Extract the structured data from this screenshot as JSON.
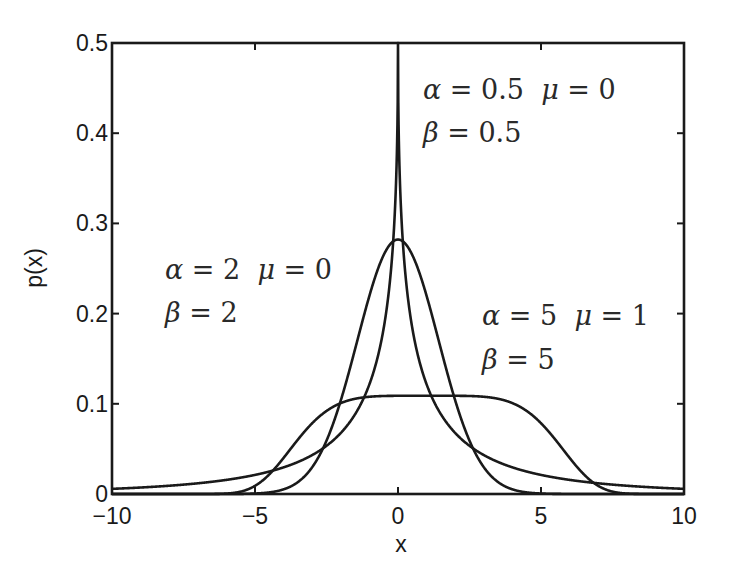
{
  "chart_data": {
    "type": "line",
    "title": "",
    "xlabel": "x",
    "ylabel": "p(x)",
    "xlim": [
      -10,
      10
    ],
    "ylim": [
      0,
      0.5
    ],
    "grid": false,
    "legend": "none (inline annotations)",
    "x_ticks": [
      -10,
      -5,
      0,
      5,
      10
    ],
    "x_tick_labels": [
      "−10",
      "−5",
      "0",
      "5",
      "10"
    ],
    "y_ticks": [
      0,
      0.1,
      0.2,
      0.3,
      0.4,
      0.5
    ],
    "y_tick_labels": [
      "0",
      "0.1",
      "0.2",
      "0.3",
      "0.4",
      "0.5"
    ],
    "formula": "p(x) = beta / (2 * alpha * Gamma(1/beta)) * exp(-(|x - mu| / alpha)^beta)",
    "series": [
      {
        "name": "alpha=0.5, mu=0, beta=0.5",
        "alpha": 0.5,
        "mu": 0,
        "beta": 0.5,
        "peak": 0.5,
        "x": [
          -10,
          -5,
          -2,
          -1,
          -0.5,
          0,
          0.5,
          1,
          2,
          5,
          10
        ],
        "values": [
          0.0057,
          0.021,
          0.064,
          0.122,
          0.184,
          0.5,
          0.184,
          0.122,
          0.064,
          0.021,
          0.0057
        ],
        "annotation": {
          "line1": [
            "α",
            " = 0.5  ",
            "μ",
            " = 0"
          ],
          "line2": [
            "β",
            " = 0.5"
          ]
        }
      },
      {
        "name": "alpha=2, mu=0, beta=2",
        "alpha": 2,
        "mu": 0,
        "beta": 2,
        "peak": 0.282,
        "x": [
          -10,
          -5,
          -4,
          -3,
          -2,
          -1,
          0,
          1,
          2,
          3,
          4,
          5,
          10
        ],
        "values": [
          0.0,
          0.0006,
          0.0052,
          0.03,
          0.104,
          0.22,
          0.282,
          0.22,
          0.104,
          0.03,
          0.0052,
          0.0006,
          0.0
        ],
        "annotation": {
          "line1": [
            "α",
            " = 2  ",
            "μ",
            " = 0"
          ],
          "line2": [
            "β",
            " = 2"
          ]
        }
      },
      {
        "name": "alpha=5, mu=1, beta=5",
        "alpha": 5,
        "mu": 1,
        "beta": 5,
        "peak": 0.109,
        "x": [
          -10,
          -6,
          -5,
          -4,
          -3,
          -2,
          0,
          1,
          2,
          4,
          5,
          6,
          7,
          8,
          10
        ],
        "values": [
          0.0,
          0.0,
          0.0008,
          0.0401,
          0.0785,
          0.1004,
          0.1089,
          0.1089,
          0.1089,
          0.1004,
          0.0785,
          0.0401,
          0.0099,
          0.0008,
          0.0
        ],
        "annotation": {
          "line1": [
            "α",
            " = 5  ",
            "μ",
            " = 1"
          ],
          "line2": [
            "β",
            " = 5"
          ]
        }
      }
    ]
  },
  "layout": {
    "plot_box": {
      "left": 112,
      "top": 43,
      "right": 684,
      "bottom": 494
    },
    "line_color": "#1a1a1a",
    "background": "#ffffff",
    "annotation_positions": [
      {
        "x": 423,
        "y1": 99,
        "y2": 142
      },
      {
        "x": 165,
        "y1": 279,
        "y2": 322
      },
      {
        "x": 482,
        "y1": 325,
        "y2": 369
      }
    ]
  }
}
